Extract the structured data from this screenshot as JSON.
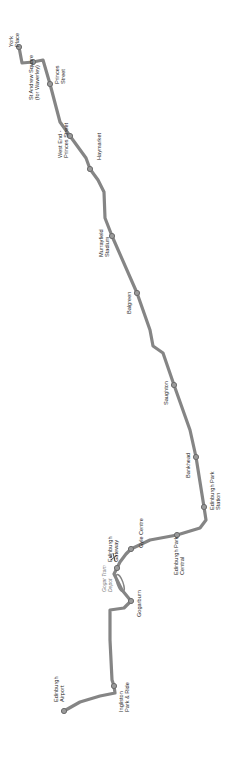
{
  "map": {
    "line_color": "#858585",
    "stop_fill": "#9a9a9a",
    "stops": [
      {
        "name_line1": "York",
        "name_line2": "Place",
        "x": 19,
        "y": 47,
        "lx": 13,
        "ly": 47
      },
      {
        "name_line1": "St Andrew Square",
        "name_line2": "(for Waverley)",
        "x": 33,
        "y": 62,
        "lx": 33,
        "ly": 100
      },
      {
        "name_line1": "Princes",
        "name_line2": "Street",
        "x": 50,
        "y": 84,
        "lx": 59,
        "ly": 84
      },
      {
        "name_line1": "West End -",
        "name_line2": "Princes Street",
        "x": 70,
        "y": 136,
        "lx": 62,
        "ly": 158
      },
      {
        "name_line1": "Haymarket",
        "name_line2": "",
        "x": 90,
        "y": 169,
        "lx": 101,
        "ly": 160
      },
      {
        "name_line1": "Murrayfield",
        "name_line2": "Stadium",
        "x": 112,
        "y": 236,
        "lx": 103,
        "ly": 257
      },
      {
        "name_line1": "Balgreen",
        "name_line2": "",
        "x": 137,
        "y": 293,
        "lx": 131,
        "ly": 314
      },
      {
        "name_line1": "Saughton",
        "name_line2": "",
        "x": 174,
        "y": 385,
        "lx": 168,
        "ly": 405
      },
      {
        "name_line1": "Bankhead",
        "name_line2": "",
        "x": 196,
        "y": 457,
        "lx": 190,
        "ly": 478
      },
      {
        "name_line1": "Edinburgh Park",
        "name_line2": "Station",
        "x": 204,
        "y": 507,
        "lx": 214,
        "ly": 510
      },
      {
        "name_line1": "Edinburgh Park",
        "name_line2": "Central",
        "x": 177,
        "y": 535,
        "lx": 178,
        "ly": 575
      },
      {
        "name_line1": "Gyle Centre",
        "name_line2": "",
        "x": 131,
        "y": 549,
        "lx": 143,
        "ly": 548
      },
      {
        "name_line1": "Edinburgh",
        "name_line2": "Gateway",
        "x": 117,
        "y": 568,
        "lx": 112,
        "ly": 562
      },
      {
        "name_line1": "Gogarburn",
        "name_line2": "",
        "x": 131,
        "y": 601,
        "lx": 141,
        "ly": 617
      },
      {
        "name_line1": "Ingliston",
        "name_line2": "Park & Ride",
        "x": 114,
        "y": 686,
        "lx": 123,
        "ly": 712
      },
      {
        "name_line1": "Edinburgh",
        "name_line2": "Airport",
        "x": 64,
        "y": 711,
        "lx": 58,
        "ly": 702
      }
    ],
    "depot": {
      "label_line1": "Gogar Tram",
      "label_line2": "Depot"
    }
  }
}
